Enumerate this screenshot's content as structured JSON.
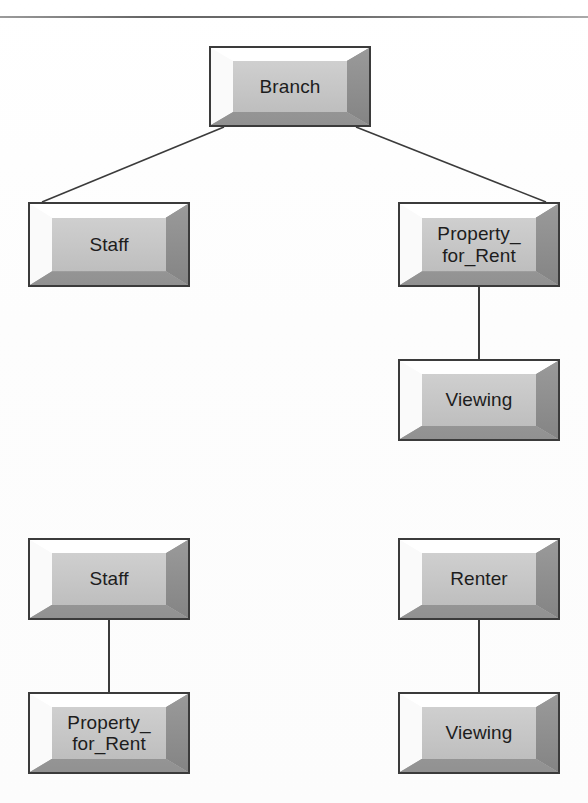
{
  "diagram": {
    "title_rule": "horizontal-rule",
    "background_color": "#fefefe",
    "box_face_color": "#c8c8c8",
    "box_border_color": "#3b3b3b",
    "connector_color": "#3b3b3b",
    "nodes": [
      {
        "id": "branch",
        "label": "Branch",
        "x": 209,
        "y": 46,
        "w": 162,
        "h": 81
      },
      {
        "id": "staff-top",
        "label": "Staff",
        "x": 28,
        "y": 202,
        "w": 162,
        "h": 85
      },
      {
        "id": "property-top",
        "label": "Property_\nfor_Rent",
        "x": 398,
        "y": 202,
        "w": 162,
        "h": 85
      },
      {
        "id": "viewing-top",
        "label": "Viewing",
        "x": 398,
        "y": 359,
        "w": 162,
        "h": 82
      },
      {
        "id": "staff-bottom",
        "label": "Staff",
        "x": 28,
        "y": 538,
        "w": 162,
        "h": 82
      },
      {
        "id": "renter",
        "label": "Renter",
        "x": 398,
        "y": 538,
        "w": 162,
        "h": 82
      },
      {
        "id": "property-bottom",
        "label": "Property_\nfor_Rent",
        "x": 28,
        "y": 692,
        "w": 162,
        "h": 82
      },
      {
        "id": "viewing-bottom",
        "label": "Viewing",
        "x": 398,
        "y": 692,
        "w": 162,
        "h": 82
      }
    ],
    "edges": [
      {
        "id": "branch-to-staff",
        "from": "branch",
        "to": "staff-top",
        "kind": "diagonal"
      },
      {
        "id": "branch-to-property",
        "from": "branch",
        "to": "property-top",
        "kind": "diagonal"
      },
      {
        "id": "property-to-viewing",
        "from": "property-top",
        "to": "viewing-top",
        "kind": "vertical"
      },
      {
        "id": "staff-to-property-bottom",
        "from": "staff-bottom",
        "to": "property-bottom",
        "kind": "vertical"
      },
      {
        "id": "renter-to-viewing-bottom",
        "from": "renter",
        "to": "viewing-bottom",
        "kind": "vertical"
      }
    ]
  }
}
